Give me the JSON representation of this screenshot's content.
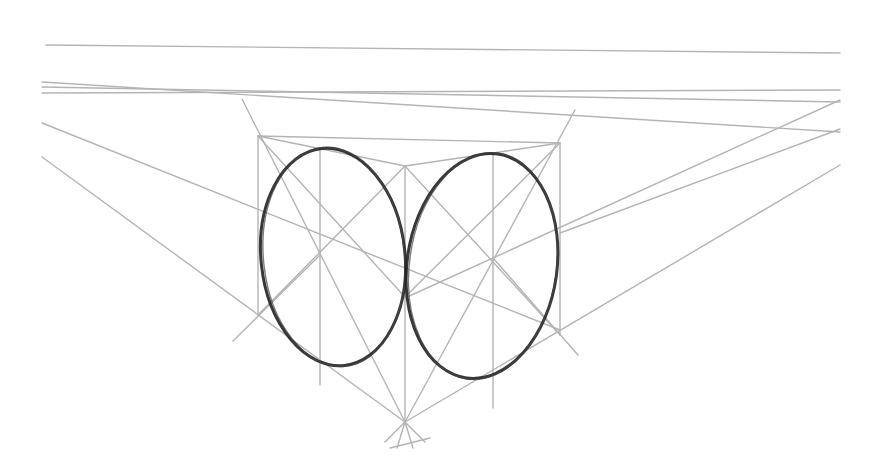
{
  "drawing": {
    "title": "Two-point perspective ellipses in cube faces",
    "colors": {
      "guide": "#b4b4b4",
      "sketch": "#222222",
      "background": "#ffffff"
    },
    "horizon_line": [
      46,
      45,
      840,
      53
    ],
    "guide_lines": [
      [
        42,
        82,
        840,
        132
      ],
      [
        42,
        87,
        840,
        102
      ],
      [
        42,
        93,
        840,
        90
      ],
      [
        42,
        123,
        560,
        330
      ],
      [
        42,
        157,
        405,
        422
      ],
      [
        840,
        100,
        405,
        298
      ],
      [
        840,
        129,
        560,
        233
      ],
      [
        840,
        165,
        405,
        422
      ],
      [
        242,
        99,
        405,
        422
      ],
      [
        575,
        110,
        405,
        422
      ],
      [
        258,
        136,
        258,
        315
      ],
      [
        405,
        166,
        405,
        422
      ],
      [
        560,
        143,
        560,
        335
      ],
      [
        320,
        148,
        320,
        385
      ],
      [
        493,
        153,
        493,
        408
      ],
      [
        258,
        136,
        560,
        143
      ],
      [
        258,
        136,
        405,
        166
      ],
      [
        405,
        166,
        560,
        143
      ],
      [
        258,
        136,
        405,
        297
      ],
      [
        405,
        166,
        258,
        315
      ],
      [
        405,
        166,
        560,
        335
      ],
      [
        560,
        143,
        405,
        297
      ],
      [
        233,
        341,
        320,
        255
      ],
      [
        578,
        355,
        493,
        258
      ],
      [
        390,
        448,
        430,
        438
      ]
    ],
    "ellipses": [
      {
        "name": "left-face-ellipse",
        "cx": 333,
        "cy": 257,
        "rx": 72,
        "ry": 109,
        "rotate": -6
      },
      {
        "name": "right-face-ellipse",
        "cx": 482,
        "cy": 266,
        "rx": 75,
        "ry": 113,
        "rotate": 8
      }
    ],
    "vanishing_convergence": {
      "x": 405,
      "y": 422
    }
  }
}
